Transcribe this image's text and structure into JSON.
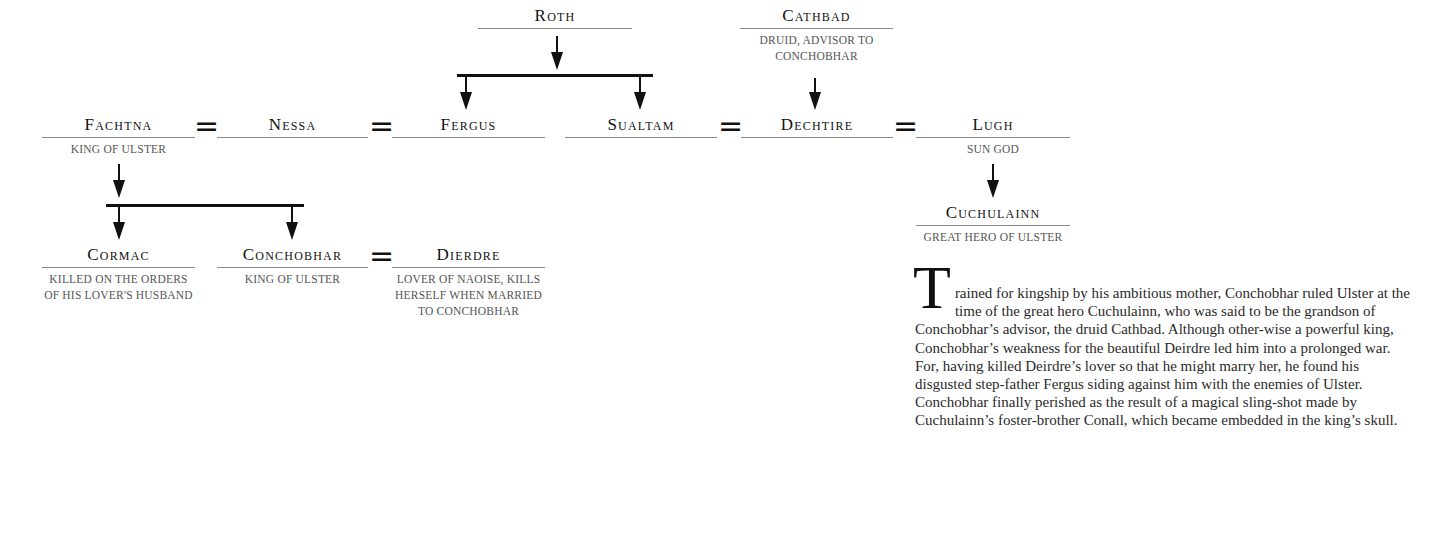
{
  "diagram": {
    "people": {
      "roth": {
        "name": "Roth"
      },
      "cathbad": {
        "name": "Cathbad",
        "desc_lines": [
          "DRUID, ADVISOR TO",
          "CONCHOBHAR"
        ]
      },
      "fachtna": {
        "name": "Fachtna",
        "desc_lines": [
          "KING OF ULSTER"
        ]
      },
      "nessa": {
        "name": "Nessa"
      },
      "fergus": {
        "name": "Fergus"
      },
      "sualtam": {
        "name": "Sualtam"
      },
      "dechtire": {
        "name": "Dechtire"
      },
      "lugh": {
        "name": "Lugh",
        "desc_lines": [
          "SUN GOD"
        ]
      },
      "cuchulainn": {
        "name": "Cuchulainn",
        "desc_lines": [
          "GREAT HERO OF ULSTER"
        ]
      },
      "cormac": {
        "name": "Cormac",
        "desc_lines": [
          "KILLED ON THE ORDERS",
          "OF HIS LOVER'S HUSBAND"
        ]
      },
      "conchobhar": {
        "name": "Conchobhar",
        "desc_lines": [
          "KING OF ULSTER"
        ]
      },
      "dierdre": {
        "name": "Dierdre",
        "desc_lines": [
          "LOVER OF NAOISE, KILLS",
          "HERSELF WHEN MARRIED",
          "TO CONCHOBHAR"
        ]
      }
    },
    "marriage_symbol": "=",
    "relations": [
      {
        "type": "marriage",
        "a": "Fachtna",
        "b": "Nessa"
      },
      {
        "type": "marriage",
        "a": "Nessa",
        "b": "Fergus"
      },
      {
        "type": "marriage",
        "a": "Sualtam",
        "b": "Dechtire"
      },
      {
        "type": "marriage",
        "a": "Dechtire",
        "b": "Lugh"
      },
      {
        "type": "marriage",
        "a": "Conchobhar",
        "b": "Dierdre"
      },
      {
        "type": "descent",
        "parent": "Roth",
        "children": [
          "Fergus",
          "Sualtam"
        ]
      },
      {
        "type": "descent",
        "parent": "Cathbad",
        "children": [
          "Dechtire"
        ]
      },
      {
        "type": "descent",
        "parent": "Fachtna",
        "children": [
          "Cormac",
          "Conchobhar"
        ]
      },
      {
        "type": "descent",
        "parent": "Lugh",
        "children": [
          "Cuchulainn"
        ]
      }
    ]
  },
  "text": {
    "drop_cap": "T",
    "first_line": "rained for kingship by his ambitious mother, Conchobhar ruled",
    "body": "Ulster at the time of the great hero Cuchulainn, who was said to be the grandson of Conchobhar’s advisor, the druid Cathbad. Although other-wise a powerful king, Conchobhar’s weakness for the beautiful Deirdre led him into a prolonged war. For, having killed Deirdre’s lover so that he might marry her, he found his disgusted step-father Fergus siding against him with the enemies of Ulster. Conchobhar finally perished as the result of a magical sling-shot made by Cuchulainn’s foster-brother Conall, which became embedded in the king’s skull."
  }
}
